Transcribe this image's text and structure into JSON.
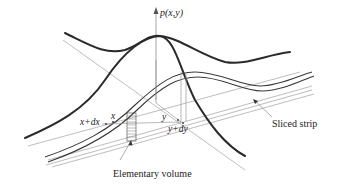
{
  "diagram": {
    "type": "3d-probability-density-surface",
    "axis_label": "p(x,y)",
    "labels": {
      "x": "x",
      "x_plus_dx": "x+dx",
      "y": "y",
      "y_plus_dy": "y+dy",
      "sliced_strip": "Sliced strip",
      "elementary_volume": "Elementary volume"
    },
    "colors": {
      "curve": "#2a2a2a",
      "thin_line": "#9a9a9a",
      "axis": "#777777",
      "text": "#222222",
      "background": "#ffffff"
    }
  }
}
